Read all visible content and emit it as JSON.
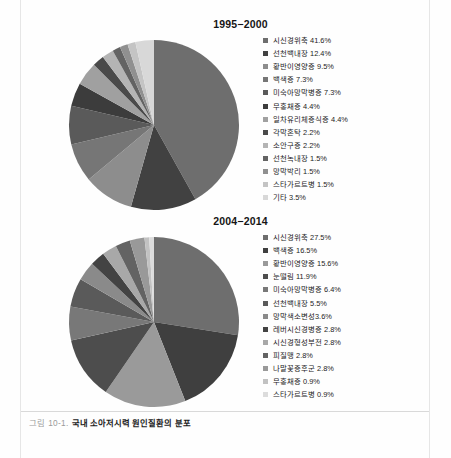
{
  "caption": {
    "number": "그림 10-1.",
    "text": "국내 소아저시력 원인질환의 분포"
  },
  "chart_data": [
    {
      "type": "pie",
      "title": "1995−2000",
      "legend_position": "right",
      "categories": [
        "시신경위축",
        "선천백내장",
        "황반이영양증",
        "백색증",
        "미숙아망막병증",
        "무홍채증",
        "일차유리체증식증",
        "각막혼탁",
        "소안구증",
        "선천녹내장",
        "망막박리",
        "스타가르트병",
        "기타"
      ],
      "values": [
        41.6,
        12.4,
        9.5,
        7.3,
        7.3,
        4.4,
        4.4,
        2.2,
        2.2,
        1.5,
        1.5,
        1.5,
        3.5
      ],
      "labels": [
        "시신경위축 41.6%",
        "선천백내장 12.4%",
        "황반이영양증 9.5%",
        "백색증 7.3%",
        "미숙아망막병증 7.3%",
        "무홍채증 4.4%",
        "일차유리체증식증 4.4%",
        "각막혼탁 2.2%",
        "소안구증 2.2%",
        "선천녹내장 1.5%",
        "망막박리 1.5%",
        "스타가르트병 1.5%",
        "기타 3.5%"
      ],
      "colors": [
        "#6e6e6e",
        "#414141",
        "#8d8d8d",
        "#767676",
        "#5a5a5a",
        "#3c3c3c",
        "#a0a0a0",
        "#4a4a4a",
        "#b4b4b4",
        "#636363",
        "#909090",
        "#c4c4c4",
        "#d8d8d8"
      ]
    },
    {
      "type": "pie",
      "title": "2004−2014",
      "legend_position": "right",
      "categories": [
        "시신경위축",
        "백색증",
        "황반이영양증",
        "눈떨림",
        "미숙아망막병증",
        "선천백내장",
        "망막색소변성",
        "레버시신경병증",
        "시신경형성부전",
        "피질맹",
        "나말꽃증후군",
        "무홍채증",
        "스타가르트병"
      ],
      "values": [
        27.5,
        16.5,
        15.6,
        11.9,
        6.4,
        5.5,
        3.6,
        2.8,
        2.8,
        2.8,
        2.8,
        0.9,
        0.9
      ],
      "labels": [
        "시신경위축 27.5%",
        "백색증 16.5%",
        "황반이영양증 15.6%",
        "눈떨림 11.9%",
        "미숙아망막병증 6.4%",
        "선천백내장 5.5%",
        "망막색소변성3.6%",
        "레버시신경병증 2.8%",
        "시신경형성부전 2.8%",
        "피질맹 2.8%",
        "나말꽃증후군 2.8%",
        "무홍채증 0.9%",
        "스타가르트병 0.9%"
      ],
      "colors": [
        "#6e6e6e",
        "#3f3f3f",
        "#9a9a9a",
        "#4d4d4d",
        "#787878",
        "#5a5a5a",
        "#8a8a8a",
        "#434343",
        "#a8a8a8",
        "#636363",
        "#999999",
        "#c2c2c2",
        "#dcdcdc"
      ]
    }
  ]
}
